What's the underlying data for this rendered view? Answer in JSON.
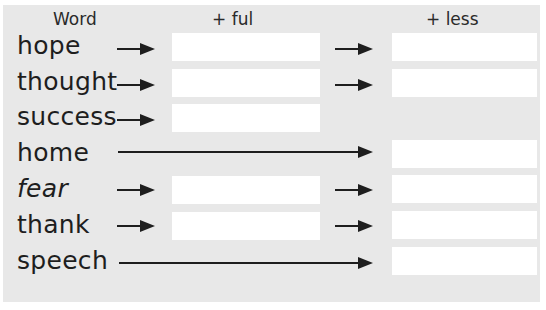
{
  "headers": {
    "word": "Word",
    "ful": "+ ful",
    "less": "+ less"
  },
  "rows": [
    {
      "word": "hope",
      "ful_field": "",
      "less_field": ""
    },
    {
      "word": "thought",
      "ful_field": "",
      "less_field": ""
    },
    {
      "word": "success",
      "ful_field": ""
    },
    {
      "word": "home",
      "less_field": ""
    },
    {
      "word": "fear",
      "ful_field": "",
      "less_field": ""
    },
    {
      "word": "thank",
      "ful_field": "",
      "less_field": ""
    },
    {
      "word": "speech",
      "less_field": ""
    }
  ],
  "colors": {
    "panel": "#e8e8e8",
    "box": "#ffffff",
    "ink": "#1e1e1e"
  }
}
